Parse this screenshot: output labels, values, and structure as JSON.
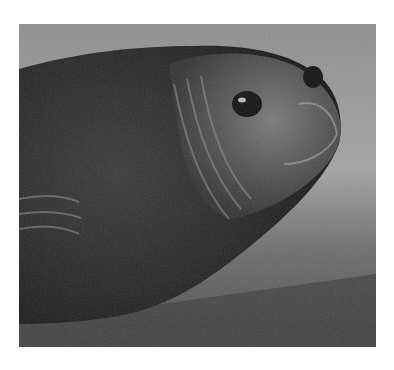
{
  "image": {
    "subject": "Elephant seal pup resting on gravel beach",
    "style": "black-and-white photograph",
    "colors": {
      "background": "#ffffff",
      "sky_gravel_light": "#9a9a9a",
      "seal_body": "#2a2a2a",
      "gravel_dark": "#4a4a4a"
    }
  }
}
